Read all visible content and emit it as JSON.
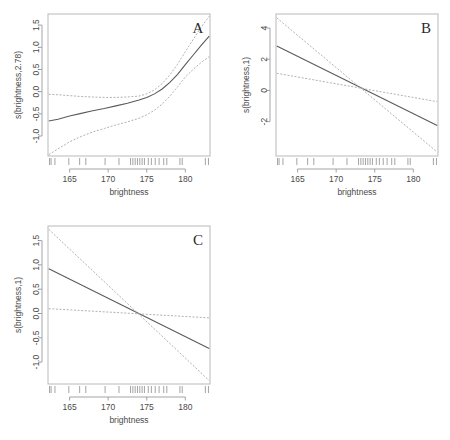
{
  "figure": {
    "background": "#ffffff",
    "width": 450,
    "height": 440,
    "panel_count": 3
  },
  "chart_data": [
    {
      "type": "line",
      "panel_label": "A",
      "title": "",
      "xlabel": "brightness",
      "ylabel": "s(brightness,2.78)",
      "xlim": [
        162.2,
        183.2
      ],
      "ylim": [
        -1.45,
        1.75
      ],
      "xticks": [
        165,
        170,
        175,
        180
      ],
      "yticks": [
        -1.0,
        -0.5,
        0.0,
        0.5,
        1.0,
        1.5
      ],
      "ytick_labels": [
        "-1.0",
        "-0.5",
        "0.0",
        "0.5",
        "1.0",
        "1.5"
      ],
      "xtick_labels": [
        "165",
        "170",
        "175",
        "180"
      ],
      "grid": false,
      "legend": "none",
      "series": [
        {
          "name": "fit",
          "style": "solid",
          "color": "#5b5b5b",
          "x": [
            162.3,
            163.5,
            165.0,
            166.5,
            168.0,
            169.5,
            171.0,
            172.5,
            174.0,
            175.0,
            176.0,
            177.0,
            178.0,
            179.0,
            180.0,
            181.0,
            182.0,
            183.1
          ],
          "y": [
            -0.66,
            -0.62,
            -0.55,
            -0.49,
            -0.43,
            -0.38,
            -0.32,
            -0.26,
            -0.19,
            -0.13,
            -0.05,
            0.06,
            0.21,
            0.39,
            0.61,
            0.82,
            1.03,
            1.25
          ]
        },
        {
          "name": "upper-ci",
          "style": "dashed",
          "color": "#a8a8a8",
          "x": [
            162.3,
            163.5,
            165.0,
            166.5,
            168.0,
            169.5,
            171.0,
            172.5,
            174.0,
            175.0,
            176.0,
            177.0,
            178.0,
            179.0,
            180.0,
            181.0,
            182.0,
            183.1
          ],
          "y": [
            -0.06,
            -0.07,
            -0.09,
            -0.11,
            -0.12,
            -0.13,
            -0.13,
            -0.12,
            -0.1,
            -0.05,
            0.04,
            0.18,
            0.38,
            0.62,
            0.9,
            1.17,
            1.44,
            1.7
          ]
        },
        {
          "name": "lower-ci",
          "style": "dashed",
          "color": "#a8a8a8",
          "x": [
            162.3,
            163.5,
            165.0,
            166.5,
            168.0,
            169.5,
            171.0,
            172.5,
            174.0,
            175.0,
            176.0,
            177.0,
            178.0,
            179.0,
            180.0,
            181.0,
            182.0,
            183.1
          ],
          "y": [
            -1.42,
            -1.29,
            -1.13,
            -1.01,
            -0.91,
            -0.83,
            -0.75,
            -0.68,
            -0.6,
            -0.52,
            -0.42,
            -0.28,
            -0.1,
            0.11,
            0.33,
            0.5,
            0.65,
            0.79
          ]
        }
      ],
      "rug": [
        162.4,
        162.6,
        163.1,
        164.9,
        166.3,
        167.1,
        169.6,
        171.4,
        172.9,
        173.2,
        173.5,
        173.8,
        174.1,
        174.4,
        174.7,
        175.2,
        175.6,
        176.1,
        176.6,
        177.2,
        177.6,
        179.3,
        179.6,
        182.6,
        183.0
      ]
    },
    {
      "type": "line",
      "panel_label": "B",
      "title": "",
      "xlabel": "brightness",
      "ylabel": "s(brightness,1)",
      "xlim": [
        162.2,
        183.2
      ],
      "ylim": [
        -4.2,
        4.9
      ],
      "xticks": [
        165,
        170,
        175,
        180
      ],
      "yticks": [
        -2,
        0,
        2,
        4
      ],
      "ytick_labels": [
        "-2",
        "0",
        "2",
        "4"
      ],
      "xtick_labels": [
        "165",
        "170",
        "175",
        "180"
      ],
      "grid": false,
      "legend": "none",
      "series": [
        {
          "name": "fit",
          "style": "solid",
          "color": "#5b5b5b",
          "x": [
            162.3,
            183.1
          ],
          "y": [
            2.85,
            -2.25
          ]
        },
        {
          "name": "upper-ci",
          "style": "dashed",
          "color": "#a8a8a8",
          "x": [
            162.3,
            183.1
          ],
          "y": [
            1.1,
            -0.72
          ]
        },
        {
          "name": "lower-ci",
          "style": "dashed",
          "color": "#a8a8a8",
          "x": [
            162.3,
            183.1
          ],
          "y": [
            4.65,
            -3.95
          ]
        }
      ],
      "rug": [
        162.4,
        162.6,
        163.1,
        164.9,
        166.3,
        167.1,
        169.6,
        171.4,
        172.9,
        173.2,
        173.5,
        173.8,
        174.1,
        174.4,
        174.7,
        175.2,
        175.6,
        176.1,
        176.6,
        177.2,
        177.6,
        179.3,
        179.6,
        182.6,
        183.0
      ]
    },
    {
      "type": "line",
      "panel_label": "C",
      "title": "",
      "xlabel": "brightness",
      "ylabel": "s(brightness,1)",
      "xlim": [
        162.2,
        183.2
      ],
      "ylim": [
        -1.45,
        1.8
      ],
      "xticks": [
        165,
        170,
        175,
        180
      ],
      "yticks": [
        -1.0,
        -0.5,
        0.0,
        0.5,
        1.0,
        1.5
      ],
      "ytick_labels": [
        "-1.0",
        "-0.5",
        "0.0",
        "0.5",
        "1.0",
        "1.5"
      ],
      "xtick_labels": [
        "165",
        "170",
        "175",
        "180"
      ],
      "grid": false,
      "legend": "none",
      "series": [
        {
          "name": "fit",
          "style": "solid",
          "color": "#5b5b5b",
          "x": [
            162.3,
            183.1
          ],
          "y": [
            0.92,
            -0.72
          ]
        },
        {
          "name": "upper-ci",
          "style": "dashed",
          "color": "#a8a8a8",
          "x": [
            162.3,
            183.1
          ],
          "y": [
            0.1,
            -0.09
          ]
        },
        {
          "name": "lower-ci",
          "style": "dashed",
          "color": "#a8a8a8",
          "x": [
            162.3,
            183.1
          ],
          "y": [
            1.73,
            -1.38
          ]
        }
      ],
      "rug": [
        162.4,
        162.6,
        163.1,
        164.9,
        166.3,
        167.1,
        169.6,
        171.4,
        172.9,
        173.2,
        173.5,
        173.8,
        174.1,
        174.4,
        174.7,
        175.2,
        175.6,
        176.1,
        176.6,
        177.2,
        177.6,
        179.3,
        179.6,
        182.6,
        183.0
      ]
    }
  ]
}
